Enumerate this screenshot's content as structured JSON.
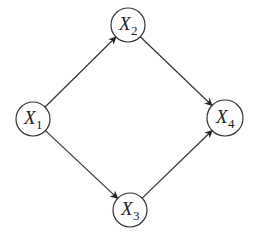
{
  "diagram": {
    "type": "directed-graph",
    "colors": {
      "stroke": "#333333",
      "background": "#ffffff",
      "text": "#222222"
    },
    "nodes": [
      {
        "id": "X1",
        "letter": "X",
        "subscript": "1",
        "cx": 33,
        "cy": 119,
        "r": 17
      },
      {
        "id": "X2",
        "letter": "X",
        "subscript": "2",
        "cx": 128,
        "cy": 25,
        "r": 17
      },
      {
        "id": "X3",
        "letter": "X",
        "subscript": "3",
        "cx": 130,
        "cy": 210,
        "r": 17
      },
      {
        "id": "X4",
        "letter": "X",
        "subscript": "4",
        "cx": 225,
        "cy": 118,
        "r": 18
      }
    ],
    "edges": [
      {
        "from": "X1",
        "to": "X2"
      },
      {
        "from": "X1",
        "to": "X3"
      },
      {
        "from": "X2",
        "to": "X4"
      },
      {
        "from": "X3",
        "to": "X4"
      }
    ]
  }
}
